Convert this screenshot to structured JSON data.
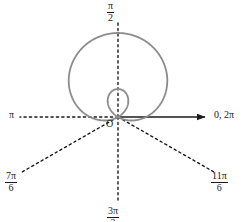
{
  "figure": {
    "background_color": "#ffffff",
    "curve_color": "#8c8c8c",
    "axis_color": "#1a1a1a",
    "dash_color": "#1a1a1a",
    "width": 250,
    "height": 221
  },
  "origin": {
    "label": "O",
    "x": 118,
    "y": 117
  },
  "axis_labels": {
    "right": {
      "text": "0, 2π",
      "angle_deg": 0,
      "style": "plain"
    },
    "top": {
      "numerator": "π",
      "denominator": "2",
      "text": "π/2",
      "angle_deg": 90,
      "style": "fraction"
    },
    "left": {
      "text": "π",
      "angle_deg": 180,
      "style": "plain"
    },
    "bottom_left": {
      "numerator": "7π",
      "denominator": "6",
      "text": "7π/6",
      "angle_deg": 210,
      "style": "fraction"
    },
    "bottom": {
      "numerator": "3π",
      "denominator": "2",
      "text": "3π/2",
      "angle_deg": 270,
      "style": "fraction"
    },
    "bottom_right": {
      "numerator": "11π",
      "denominator": "6",
      "text": "11π/6",
      "angle_deg": 330,
      "style": "fraction"
    }
  },
  "chart_data": {
    "type": "line",
    "plot_kind": "polar",
    "title": "",
    "xlabel": "",
    "ylabel": "",
    "grid": false,
    "legend": null,
    "curve_name": "limacon-with-inner-loop",
    "equation": "r = 1 + 2 sin(theta)",
    "theta_range_rad": [
      0,
      6.283185307179586
    ],
    "r_max": 3,
    "r_min": -1,
    "features": {
      "outer_loop_top_r": 3,
      "inner_loop_bottom_r": 1,
      "zeros_at_theta_rad": [
        3.665191429188092,
        5.759586531581287
      ],
      "zeros_at_theta_labels": [
        "7π/6",
        "11π/6"
      ],
      "max_at_theta_rad": 1.5707963267948966,
      "max_at_theta_label": "π/2",
      "symmetry_axis": "π/2"
    },
    "rays": [
      {
        "label": "0, 2π",
        "angle_deg": 0,
        "style": "solid-arrow"
      },
      {
        "label": "π/2",
        "angle_deg": 90,
        "style": "dashed"
      },
      {
        "label": "π",
        "angle_deg": 180,
        "style": "dashed"
      },
      {
        "label": "7π/6",
        "angle_deg": 210,
        "style": "dashed"
      },
      {
        "label": "3π/2",
        "angle_deg": 270,
        "style": "dashed"
      },
      {
        "label": "11π/6",
        "angle_deg": 330,
        "style": "dashed"
      }
    ]
  }
}
